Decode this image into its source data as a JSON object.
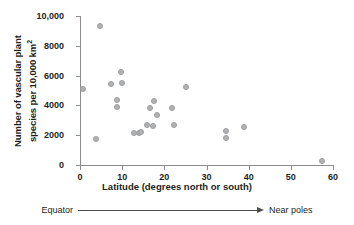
{
  "chart_data": {
    "type": "scatter",
    "title": "",
    "xlabel": "Latitude (degrees north or south)",
    "ylabel_line1": "Number of vascular plant",
    "ylabel_line2": "species per 10,000 km",
    "ylabel_superscript": "2",
    "xlim": [
      0,
      60
    ],
    "ylim": [
      0,
      10000
    ],
    "xticks": [
      0,
      10,
      20,
      30,
      40,
      50,
      60
    ],
    "xtick_labels": [
      "0",
      "10",
      "20",
      "30",
      "40",
      "50",
      "60"
    ],
    "yticks": [
      0,
      2000,
      4000,
      6000,
      8000,
      10000
    ],
    "ytick_labels": [
      "0",
      "2000",
      "4000",
      "6000",
      "8000",
      "10,000"
    ],
    "grid": false,
    "legend": null,
    "marker_color": "#b0b2b4",
    "points": [
      {
        "x": 0.6,
        "y": 5100
      },
      {
        "x": 3.8,
        "y": 1760
      },
      {
        "x": 4.8,
        "y": 9350
      },
      {
        "x": 7.4,
        "y": 5420
      },
      {
        "x": 8.8,
        "y": 4380
      },
      {
        "x": 8.8,
        "y": 3870
      },
      {
        "x": 9.7,
        "y": 6260
      },
      {
        "x": 9.9,
        "y": 5470
      },
      {
        "x": 12.8,
        "y": 2130
      },
      {
        "x": 14.0,
        "y": 2180
      },
      {
        "x": 14.4,
        "y": 2220
      },
      {
        "x": 16.0,
        "y": 2680
      },
      {
        "x": 16.6,
        "y": 3840
      },
      {
        "x": 17.3,
        "y": 2590
      },
      {
        "x": 17.6,
        "y": 4300
      },
      {
        "x": 18.3,
        "y": 3340
      },
      {
        "x": 21.9,
        "y": 3830
      },
      {
        "x": 22.3,
        "y": 2680
      },
      {
        "x": 25.2,
        "y": 5230
      },
      {
        "x": 34.7,
        "y": 2290
      },
      {
        "x": 34.7,
        "y": 1820
      },
      {
        "x": 38.8,
        "y": 2580
      },
      {
        "x": 57.3,
        "y": 250
      }
    ]
  },
  "annotation": {
    "left_text": "Equator",
    "right_text": "Near poles",
    "arrow": "right-arrow"
  }
}
